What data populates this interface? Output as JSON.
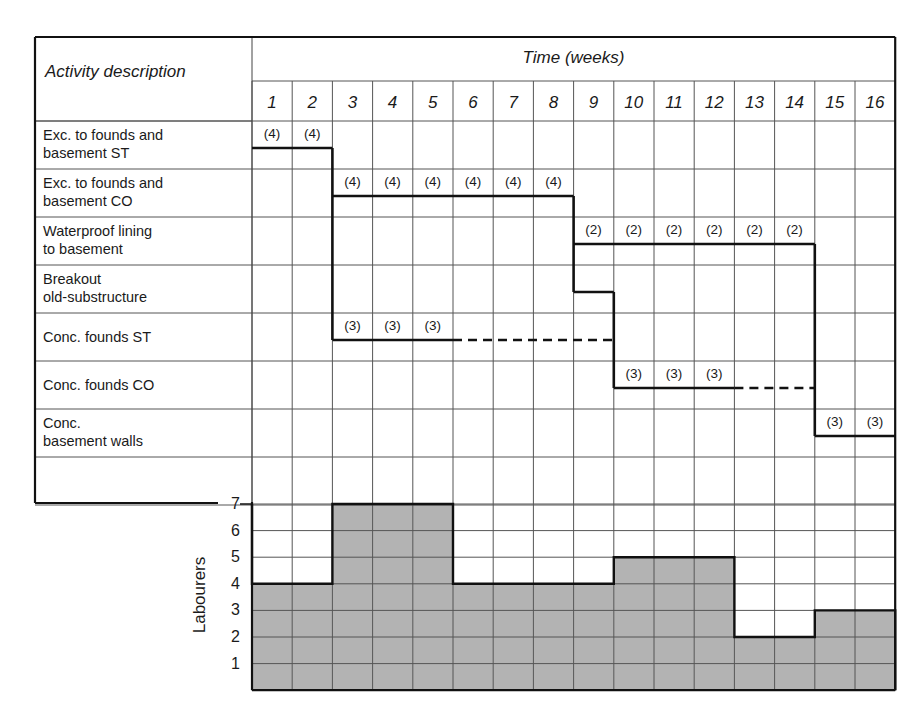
{
  "header": {
    "activity_column_title": "Activity description",
    "time_axis_title": "Time (weeks)",
    "weeks": [
      "1",
      "2",
      "3",
      "4",
      "5",
      "6",
      "7",
      "8",
      "9",
      "10",
      "11",
      "12",
      "13",
      "14",
      "15",
      "16"
    ]
  },
  "activities": [
    {
      "label": "Exc. to founds and\nbasement ST",
      "start_week": 1,
      "end_week": 2,
      "resource_label": "(4)",
      "float_to_week": null
    },
    {
      "label": "Exc. to founds and\nbasement CO",
      "start_week": 3,
      "end_week": 8,
      "resource_label": "(4)",
      "float_to_week": null
    },
    {
      "label": "Waterproof lining\nto basement",
      "start_week": 9,
      "end_week": 14,
      "resource_label": "(2)",
      "float_to_week": null
    },
    {
      "label": "Breakout\nold-substructure",
      "start_week": 9,
      "end_week": 9,
      "resource_label": "",
      "float_to_week": null
    },
    {
      "label": "Conc. founds ST",
      "start_week": 3,
      "end_week": 5,
      "resource_label": "(3)",
      "float_to_week": 9
    },
    {
      "label": "Conc. founds CO",
      "start_week": 10,
      "end_week": 12,
      "resource_label": "(3)",
      "float_to_week": 14
    },
    {
      "label": "Conc.\nbasement walls",
      "start_week": 15,
      "end_week": 16,
      "resource_label": "(3)",
      "float_to_week": null
    }
  ],
  "histogram": {
    "ylabel": "Labourers",
    "yticks": [
      "7",
      "6",
      "5",
      "4",
      "3",
      "2",
      "1"
    ],
    "fill_color": "#b3b3b3"
  },
  "chart_data": [
    {
      "type": "gantt",
      "title": "Time (weeks)",
      "xlabel": "Time (weeks)",
      "ylabel": "Activity description",
      "categories": [
        "Exc. to founds and basement ST",
        "Exc. to founds and basement CO",
        "Waterproof lining to basement",
        "Breakout old-substructure",
        "Conc. founds ST",
        "Conc. founds CO",
        "Conc. basement walls"
      ],
      "tasks": [
        {
          "name": "Exc. to founds and basement ST",
          "start": 1,
          "end": 2,
          "labourers_per_week": 4,
          "float_end": null
        },
        {
          "name": "Exc. to founds and basement CO",
          "start": 3,
          "end": 8,
          "labourers_per_week": 4,
          "float_end": null
        },
        {
          "name": "Waterproof lining to basement",
          "start": 9,
          "end": 14,
          "labourers_per_week": 2,
          "float_end": null
        },
        {
          "name": "Breakout old-substructure",
          "start": 9,
          "end": 9,
          "labourers_per_week": null,
          "float_end": null
        },
        {
          "name": "Conc. founds ST",
          "start": 3,
          "end": 5,
          "labourers_per_week": 3,
          "float_end": 9
        },
        {
          "name": "Conc. founds CO",
          "start": 10,
          "end": 12,
          "labourers_per_week": 3,
          "float_end": 14
        },
        {
          "name": "Conc. basement walls",
          "start": 15,
          "end": 16,
          "labourers_per_week": 3,
          "float_end": null
        }
      ],
      "xlim": [
        1,
        16
      ]
    },
    {
      "type": "bar",
      "title": "Resource histogram",
      "xlabel": "Time (weeks)",
      "ylabel": "Labourers",
      "categories": [
        "1",
        "2",
        "3",
        "4",
        "5",
        "6",
        "7",
        "8",
        "9",
        "10",
        "11",
        "12",
        "13",
        "14",
        "15",
        "16"
      ],
      "values": [
        4,
        4,
        7,
        7,
        7,
        4,
        4,
        4,
        4,
        5,
        5,
        5,
        2,
        2,
        3,
        3
      ],
      "ylim": [
        0,
        7
      ],
      "grid": true
    }
  ]
}
